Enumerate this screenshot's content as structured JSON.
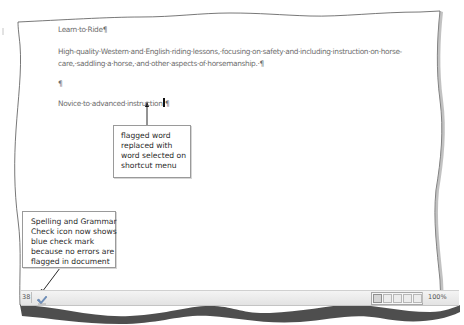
{
  "document": {
    "title_line": "Learn·to·Ride¶",
    "paragraph_line1": "High-quality·Western·and·English·riding·lessons,·focusing·on·safety·and·including·instruction·on·horse-",
    "paragraph_line2": "care,·saddling·a·horse,·and·other·aspects·of·horsemanship.·¶",
    "empty_paragraph": "¶",
    "novice_line_text": "Novice·to·advanced·instruction",
    "novice_line_pilcrow": "¶"
  },
  "callouts": {
    "replace": {
      "lines": [
        "flagged word",
        "replaced with",
        "word selected on",
        "shortcut menu"
      ]
    },
    "spelling": {
      "lines": [
        "Spelling and Grammar",
        "Check icon now shows",
        "blue check mark",
        "because no errors are",
        "flagged in document"
      ]
    }
  },
  "status_bar": {
    "page_indicator": "38",
    "spelling_icon": "spelling-grammar-check-icon",
    "view_buttons": [
      "print-layout",
      "full-screen-reading",
      "web-layout",
      "outline",
      "draft"
    ],
    "zoom_level": "100%"
  },
  "colors": {
    "text": "#6e6e6e",
    "callout_border": "#9a9a9a",
    "page_border": "#555555",
    "status_bar": "#e8e8e8"
  }
}
